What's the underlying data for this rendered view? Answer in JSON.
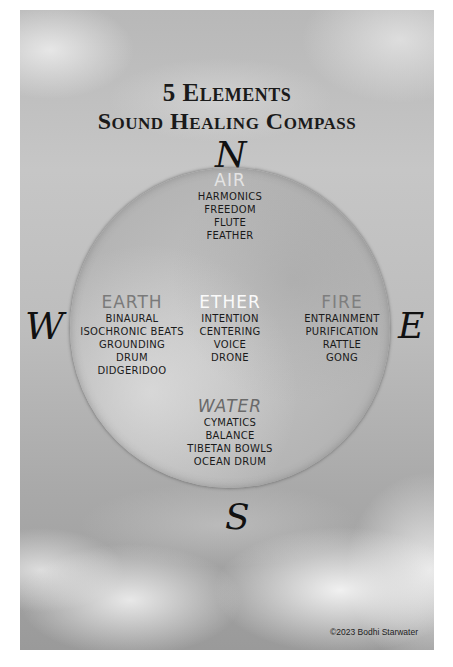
{
  "poster": {
    "title_line1": "5 Elements",
    "title_line2": "Sound Healing Compass",
    "directions": {
      "north": "N",
      "west": "W",
      "east": "E",
      "south": "S"
    },
    "elements": {
      "air": {
        "name": "AIR",
        "items": [
          "HARMONICS",
          "FREEDOM",
          "FLUTE",
          "FEATHER"
        ]
      },
      "earth": {
        "name": "EARTH",
        "items": [
          "BINAURAL",
          "ISOCHRONIC BEATS",
          "GROUNDING",
          "DRUM",
          "DIDGERIDOO"
        ]
      },
      "ether": {
        "name": "ETHER",
        "items": [
          "INTENTION",
          "CENTERING",
          "VOICE",
          "DRONE"
        ]
      },
      "fire": {
        "name": "FIRE",
        "items": [
          "ENTRAINMENT",
          "PURIFICATION",
          "RATTLE",
          "GONG"
        ]
      },
      "water": {
        "name": "WATER",
        "items": [
          "CYMATICS",
          "BALANCE",
          "TIBETAN BOWLS",
          "OCEAN DRUM"
        ]
      }
    },
    "copyright": "©2023 Bodhi Starwater"
  }
}
